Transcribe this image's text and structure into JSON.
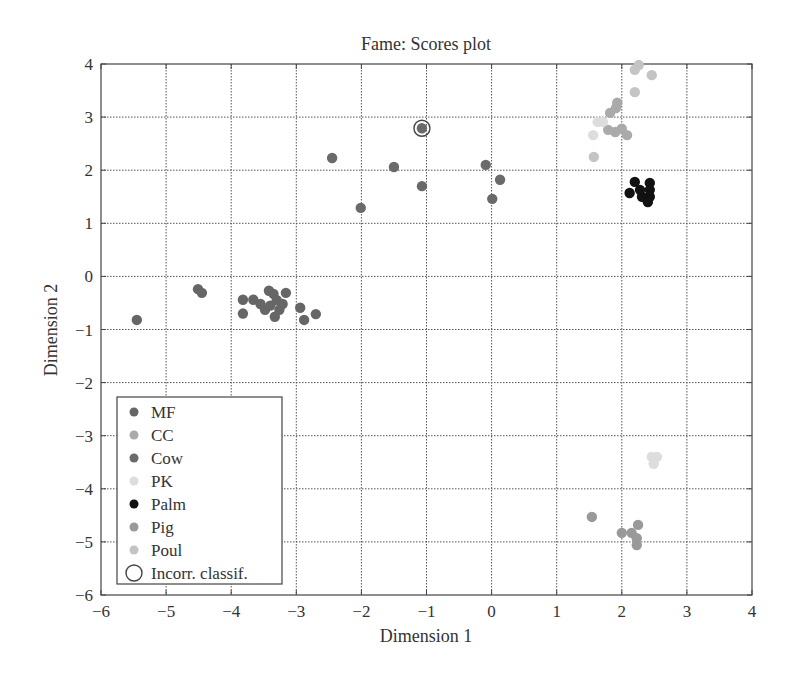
{
  "chart_data": {
    "type": "scatter",
    "title": "Fame: Scores plot",
    "xlabel": "Dimension 1",
    "ylabel": "Dimension 2",
    "xlim": [
      -6,
      4
    ],
    "ylim": [
      -6,
      4
    ],
    "xticks": [
      -6,
      -5,
      -4,
      -3,
      -2,
      -1,
      0,
      1,
      2,
      3,
      4
    ],
    "yticks": [
      -6,
      -5,
      -4,
      -3,
      -2,
      -1,
      0,
      1,
      2,
      3,
      4
    ],
    "xtick_labels": [
      "−6",
      "−5",
      "−4",
      "−3",
      "−2",
      "−1",
      "0",
      "1",
      "2",
      "3",
      "4"
    ],
    "ytick_labels": [
      "−6",
      "−5",
      "−4",
      "−3",
      "−2",
      "−1",
      "0",
      "1",
      "2",
      "3",
      "4"
    ],
    "grid": true,
    "legend_position": "lower left",
    "series": [
      {
        "name": "MF",
        "color": "#666666",
        "points": [
          [
            -5.45,
            -0.82
          ],
          [
            -4.51,
            -0.24
          ],
          [
            -4.45,
            -0.31
          ],
          [
            -3.82,
            -0.44
          ],
          [
            -3.82,
            -0.7
          ],
          [
            -3.66,
            -0.44
          ],
          [
            -3.55,
            -0.52
          ],
          [
            -3.48,
            -0.63
          ],
          [
            -3.42,
            -0.27
          ],
          [
            -3.35,
            -0.33
          ],
          [
            -3.33,
            -0.76
          ],
          [
            -3.26,
            -0.63
          ],
          [
            -3.21,
            -0.52
          ],
          [
            -3.16,
            -0.31
          ],
          [
            -2.94,
            -0.59
          ],
          [
            -2.88,
            -0.82
          ],
          [
            -2.7,
            -0.71
          ],
          [
            -3.4,
            -0.55
          ],
          [
            -3.3,
            -0.45
          ]
        ]
      },
      {
        "name": "CC",
        "color": "#aaaaaa",
        "points": [
          [
            1.93,
            3.27
          ],
          [
            1.91,
            3.17
          ],
          [
            1.82,
            3.08
          ],
          [
            1.79,
            2.76
          ],
          [
            1.9,
            2.72
          ],
          [
            2.0,
            2.78
          ],
          [
            2.08,
            2.66
          ]
        ]
      },
      {
        "name": "Cow",
        "color": "#6a6a6a",
        "points": [
          [
            -2.45,
            2.23
          ],
          [
            -1.5,
            2.06
          ],
          [
            -1.07,
            1.7
          ],
          [
            -2.01,
            1.29
          ],
          [
            -0.09,
            2.1
          ],
          [
            0.13,
            1.82
          ],
          [
            0.01,
            1.46
          ],
          [
            -1.07,
            2.79
          ]
        ]
      },
      {
        "name": "PK",
        "color": "#dddddd",
        "points": [
          [
            1.63,
            2.91
          ],
          [
            1.71,
            2.91
          ],
          [
            1.56,
            2.66
          ],
          [
            2.46,
            -3.4
          ],
          [
            2.54,
            -3.4
          ],
          [
            2.49,
            -3.53
          ]
        ]
      },
      {
        "name": "Palm",
        "color": "#111111",
        "points": [
          [
            2.2,
            1.78
          ],
          [
            2.12,
            1.57
          ],
          [
            2.28,
            1.63
          ],
          [
            2.31,
            1.5
          ],
          [
            2.43,
            1.76
          ],
          [
            2.43,
            1.63
          ],
          [
            2.43,
            1.5
          ],
          [
            2.4,
            1.4
          ]
        ]
      },
      {
        "name": "Pig",
        "color": "#999999",
        "points": [
          [
            1.54,
            -4.53
          ],
          [
            2.25,
            -4.68
          ],
          [
            2.0,
            -4.83
          ],
          [
            2.15,
            -4.83
          ],
          [
            2.23,
            -4.93
          ],
          [
            2.23,
            -5.06
          ]
        ]
      },
      {
        "name": "Poul",
        "color": "#c4c4c4",
        "points": [
          [
            2.26,
            3.98
          ],
          [
            2.2,
            3.89
          ],
          [
            2.46,
            3.79
          ],
          [
            2.2,
            3.47
          ],
          [
            1.57,
            2.25
          ]
        ]
      }
    ],
    "annotations": [
      {
        "label": "Incorr. classif.",
        "marker": "open-circle",
        "points": [
          [
            -1.07,
            2.79
          ]
        ]
      }
    ],
    "legend": [
      {
        "label": "MF",
        "color": "#666666",
        "marker": "filled-circle"
      },
      {
        "label": "CC",
        "color": "#aaaaaa",
        "marker": "filled-circle"
      },
      {
        "label": "Cow",
        "color": "#6a6a6a",
        "marker": "filled-circle"
      },
      {
        "label": "PK",
        "color": "#dddddd",
        "marker": "filled-circle"
      },
      {
        "label": "Palm",
        "color": "#111111",
        "marker": "filled-circle"
      },
      {
        "label": "Pig",
        "color": "#999999",
        "marker": "filled-circle"
      },
      {
        "label": "Poul",
        "color": "#c4c4c4",
        "marker": "filled-circle"
      },
      {
        "label": "Incorr. classif.",
        "color": "#333333",
        "marker": "open-circle"
      }
    ]
  }
}
